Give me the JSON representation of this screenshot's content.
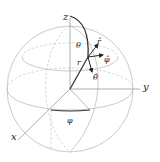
{
  "diagram": {
    "axes": {
      "x_label": "x",
      "y_label": "y",
      "z_label": "z"
    },
    "angles": {
      "theta_label": "θ",
      "phi_label": "φ"
    },
    "radius_label": "r",
    "unit_vectors": {
      "r_hat": "r̂",
      "theta_hat": "θ̂",
      "phi_hat": "φ̂"
    },
    "colors": {
      "sphere": "#bdbdbd",
      "dashed": "#c4c4c4",
      "axis": "#9a9a9a",
      "vector": "#222222"
    }
  }
}
